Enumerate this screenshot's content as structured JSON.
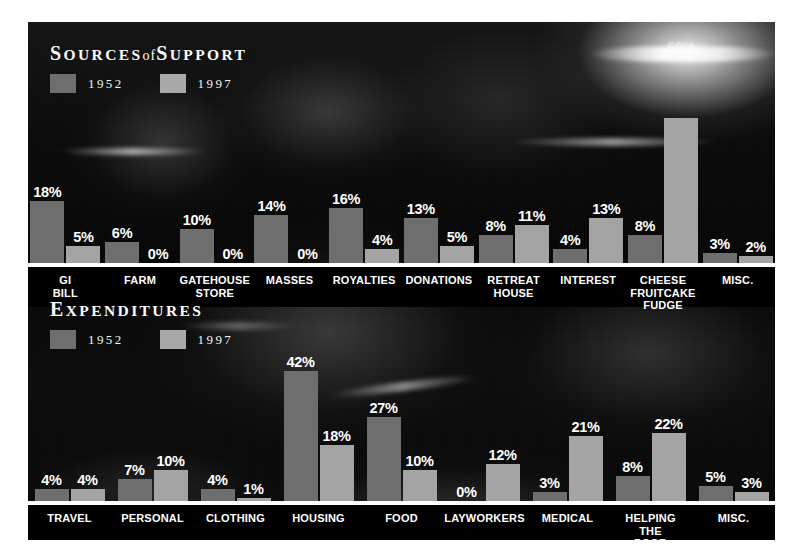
{
  "poster": {
    "background_color": "#050505",
    "bar_color_1952": "#6e6e6e",
    "bar_color_1997": "#a4a4a4",
    "baseline_color": "#ffffff",
    "text_color": "#ffffff"
  },
  "sources": {
    "title_part1": "S",
    "title_part2": "OURCES",
    "title_of": "of",
    "title_part3": "S",
    "title_part4": "UPPORT",
    "title_full": "SOURCES of SUPPORT",
    "legend": [
      {
        "label": "1952",
        "swatch": "#6e6e6e"
      },
      {
        "label": "1997",
        "swatch": "#a9a9a9"
      }
    ]
  },
  "expenditures": {
    "title_part1": "E",
    "title_part2": "XPENDITURES",
    "title_full": "EXPENDITURES",
    "legend": [
      {
        "label": "1952",
        "swatch": "#6e6e6e"
      },
      {
        "label": "1997",
        "swatch": "#a9a9a9"
      }
    ]
  },
  "chart_data": [
    {
      "type": "bar",
      "title": "SOURCES of SUPPORT",
      "xlabel": "",
      "ylabel": "",
      "ylim": [
        0,
        60
      ],
      "grid": false,
      "legend_position": "top-left",
      "value_suffix": "%",
      "categories": [
        "GI BILL",
        "FARM",
        "GATEHOUSE STORE",
        "MASSES",
        "ROYALTIES",
        "DONATIONS",
        "RETREAT HOUSE",
        "INTEREST",
        "CHEESE FRUITCAKE FUDGE",
        "MISC."
      ],
      "series": [
        {
          "name": "1952",
          "color": "#6e6e6e",
          "values": [
            18,
            6,
            10,
            14,
            16,
            13,
            8,
            4,
            8,
            3
          ]
        },
        {
          "name": "1997",
          "color": "#a4a4a4",
          "values": [
            5,
            0,
            0,
            0,
            4,
            5,
            11,
            13,
            60,
            2
          ]
        }
      ],
      "labels": {
        "1952": [
          "18%",
          "6%",
          "10%",
          "14%",
          "16%",
          "13%",
          "8%",
          "4%",
          "8%",
          "3%"
        ],
        "1997": [
          "5%",
          "0%",
          "0%",
          "0%",
          "4%",
          "5%",
          "11%",
          "13%",
          "60%",
          "2%"
        ]
      }
    },
    {
      "type": "bar",
      "title": "EXPENDITURES",
      "xlabel": "",
      "ylabel": "",
      "ylim": [
        0,
        42
      ],
      "grid": false,
      "legend_position": "top-left",
      "value_suffix": "%",
      "categories": [
        "TRAVEL",
        "PERSONAL",
        "CLOTHING",
        "HOUSING",
        "FOOD",
        "LAYWORKERS",
        "MEDICAL",
        "HELPING THE POOR",
        "MISC."
      ],
      "series": [
        {
          "name": "1952",
          "color": "#6e6e6e",
          "values": [
            4,
            7,
            4,
            42,
            27,
            0,
            3,
            8,
            5
          ]
        },
        {
          "name": "1997",
          "color": "#a4a4a4",
          "values": [
            4,
            10,
            1,
            18,
            10,
            12,
            21,
            22,
            3
          ]
        }
      ],
      "labels": {
        "1952": [
          "4%",
          "7%",
          "4%",
          "42%",
          "27%",
          "0%",
          "3%",
          "8%",
          "5%"
        ],
        "1997": [
          "4%",
          "10%",
          "1%",
          "18%",
          "10%",
          "12%",
          "21%",
          "22%",
          "3%"
        ]
      }
    }
  ]
}
